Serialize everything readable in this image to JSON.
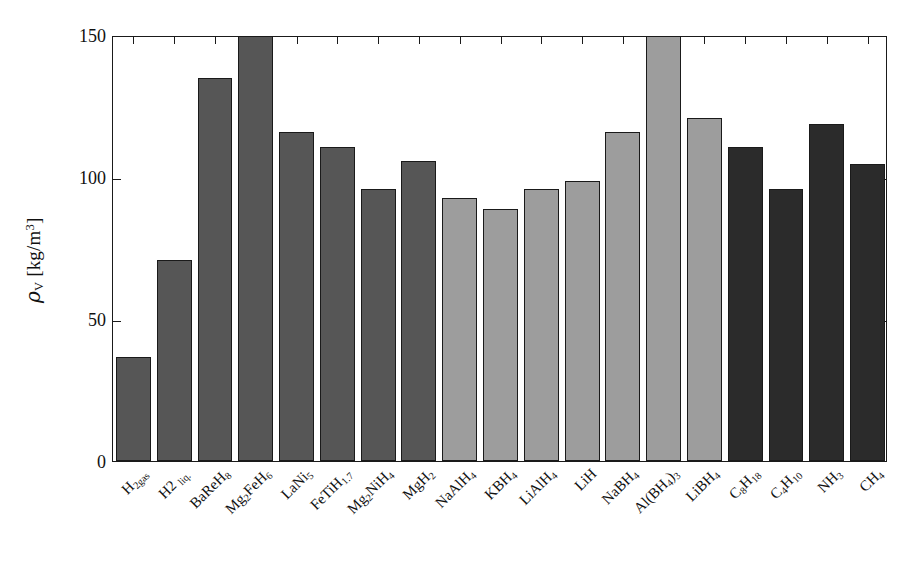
{
  "chart_data": {
    "type": "bar",
    "title": "",
    "xlabel": "",
    "ylabel_plain": "rho_V [kg/m^3]",
    "ylabel_symbol": "ρ",
    "ylabel_subscript": "V",
    "ylabel_unit": "[kg/m",
    "ylabel_unit_exp": "3",
    "ylabel_unit_close": "]",
    "ylim": [
      0,
      150
    ],
    "yticks": [
      0,
      50,
      100,
      150
    ],
    "ytick_labels": [
      "0",
      "50",
      "100",
      "150"
    ],
    "grid": false,
    "legend": "none",
    "categories": [
      "H2gas",
      "H2liq.",
      "BaReH8",
      "Mg2FeH6",
      "LaNi5",
      "FeTiH1.7",
      "Mg2NiH4",
      "MgH2",
      "NaAlH4",
      "KBH4",
      "LiAlH4",
      "LiH",
      "NaBH4",
      "Al(BH4)3",
      "LiBH4",
      "C8H18",
      "C4H10",
      "NH3",
      "CH4"
    ],
    "values": [
      36,
      70,
      134,
      150,
      115,
      110,
      95,
      105,
      92,
      88,
      95,
      98,
      115,
      150,
      120,
      110,
      95,
      118,
      104
    ],
    "clipped_at_top": [
      3,
      13
    ],
    "bar_colors": [
      "#565656",
      "#565656",
      "#565656",
      "#565656",
      "#565656",
      "#565656",
      "#565656",
      "#565656",
      "#9d9d9d",
      "#9d9d9d",
      "#9d9d9d",
      "#9d9d9d",
      "#9d9d9d",
      "#9d9d9d",
      "#9d9d9d",
      "#2b2b2b",
      "#2b2b2b",
      "#2b2b2b",
      "#2b2b2b"
    ],
    "groups": [
      {
        "name": "hydrogen and metal hydrides",
        "color": "#565656",
        "from": 0,
        "to": 7
      },
      {
        "name": "complex hydrides",
        "color": "#9d9d9d",
        "from": 8,
        "to": 14
      },
      {
        "name": "hydrocarbons and ammonia",
        "color": "#2b2b2b",
        "from": 15,
        "to": 18
      }
    ]
  },
  "xtick_labels": [
    {
      "base": "H",
      "sub1": "2gas",
      "rest": "",
      "sub2": ""
    },
    {
      "base": "H2 ",
      "sub1": "liq.",
      "rest": "",
      "sub2": ""
    },
    {
      "base": "BaReH",
      "sub1": "8",
      "rest": "",
      "sub2": ""
    },
    {
      "base": "Mg",
      "sub1": "2",
      "rest": "FeH",
      "sub2": "6"
    },
    {
      "base": "LaNi",
      "sub1": "5",
      "rest": "",
      "sub2": ""
    },
    {
      "base": "FeTiH",
      "sub1": "1.7",
      "rest": "",
      "sub2": ""
    },
    {
      "base": "Mg",
      "sub1": "2",
      "rest": "NiH",
      "sub2": "4"
    },
    {
      "base": "MgH",
      "sub1": "2",
      "rest": "",
      "sub2": ""
    },
    {
      "base": "NaAlH",
      "sub1": "4",
      "rest": "",
      "sub2": ""
    },
    {
      "base": "KBH",
      "sub1": "4",
      "rest": "",
      "sub2": ""
    },
    {
      "base": "LiAlH",
      "sub1": "4",
      "rest": "",
      "sub2": ""
    },
    {
      "base": "LiH",
      "sub1": "",
      "rest": "",
      "sub2": ""
    },
    {
      "base": "NaBH",
      "sub1": "4",
      "rest": "",
      "sub2": ""
    },
    {
      "base": "Al(BH",
      "sub1": "4",
      "rest": ")",
      "sub2": "3"
    },
    {
      "base": "LiBH",
      "sub1": "4",
      "rest": "",
      "sub2": ""
    },
    {
      "base": "C",
      "sub1": "8",
      "rest": "H",
      "sub2": "18"
    },
    {
      "base": "C",
      "sub1": "4",
      "rest": "H",
      "sub2": "10"
    },
    {
      "base": "NH",
      "sub1": "3",
      "rest": "",
      "sub2": ""
    },
    {
      "base": "CH",
      "sub1": "4",
      "rest": "",
      "sub2": ""
    }
  ]
}
